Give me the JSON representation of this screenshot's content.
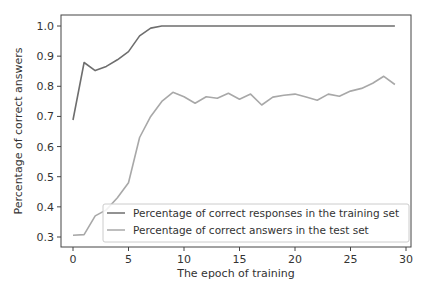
{
  "chart_data": {
    "type": "line",
    "title": "",
    "xlabel": "The epoch of training",
    "ylabel": "Percentage of correct answers",
    "xlim": [
      -1.5,
      30.5
    ],
    "ylim": [
      0.27,
      1.035
    ],
    "xticks": [
      0,
      5,
      10,
      15,
      20,
      25,
      30
    ],
    "xtick_labels": [
      "0",
      "5",
      "10",
      "15",
      "20",
      "25",
      "30"
    ],
    "yticks": [
      0.3,
      0.4,
      0.5,
      0.6,
      0.7,
      0.8,
      0.9,
      1.0
    ],
    "ytick_labels": [
      "0.3",
      "0.4",
      "0.5",
      "0.6",
      "0.7",
      "0.8",
      "0.9",
      "1.0"
    ],
    "grid": false,
    "legend_position": "lower right",
    "x": [
      0,
      1,
      2,
      3,
      4,
      5,
      6,
      7,
      8,
      9,
      10,
      11,
      12,
      13,
      14,
      15,
      16,
      17,
      18,
      19,
      20,
      21,
      22,
      23,
      24,
      25,
      26,
      27,
      28,
      29
    ],
    "series": [
      {
        "name": "Percentage of correct responses in the training set",
        "color": "#6e6e6e",
        "values": [
          0.688,
          0.879,
          0.852,
          0.866,
          0.888,
          0.915,
          0.967,
          0.993,
          1.0,
          1.0,
          1.0,
          1.0,
          1.0,
          1.0,
          1.0,
          1.0,
          1.0,
          1.0,
          1.0,
          1.0,
          1.0,
          1.0,
          1.0,
          1.0,
          1.0,
          1.0,
          1.0,
          1.0,
          1.0,
          1.0
        ]
      },
      {
        "name": "Percentage of correct answers in the test set",
        "color": "#a8a8a8",
        "values": [
          0.306,
          0.308,
          0.37,
          0.39,
          0.43,
          0.48,
          0.63,
          0.7,
          0.75,
          0.78,
          0.765,
          0.744,
          0.765,
          0.76,
          0.777,
          0.757,
          0.774,
          0.738,
          0.764,
          0.77,
          0.774,
          0.764,
          0.754,
          0.774,
          0.767,
          0.784,
          0.793,
          0.81,
          0.833,
          0.806
        ]
      }
    ]
  },
  "legend": {
    "items": [
      {
        "label": "Percentage of correct responses in the training set",
        "color": "#6e6e6e"
      },
      {
        "label": "Percentage of correct answers in the test set",
        "color": "#a8a8a8"
      }
    ]
  }
}
